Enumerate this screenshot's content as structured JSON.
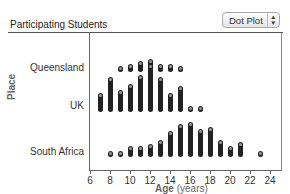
{
  "header": {
    "title": "Participating Students",
    "plot_type_select": {
      "selected": "Dot Plot"
    }
  },
  "chart_data": {
    "type": "dot",
    "title": "Participating Students",
    "xlabel": "Age",
    "xlabel_unit": "(years)",
    "ylabel": "Place",
    "xlim": [
      6,
      24
    ],
    "xticks": [
      6,
      8,
      10,
      12,
      14,
      16,
      18,
      20,
      22,
      24
    ],
    "categories": [
      "Queensland",
      "UK",
      "South Africa"
    ],
    "series": [
      {
        "name": "Queensland",
        "ages": [
          9,
          10,
          11,
          12,
          13,
          14,
          15
        ],
        "counts": [
          1,
          2,
          3,
          4,
          2,
          2,
          1
        ]
      },
      {
        "name": "UK",
        "ages": [
          7,
          8,
          9,
          10,
          11,
          12,
          13,
          14,
          15,
          16,
          17
        ],
        "counts": [
          7,
          14,
          8,
          11,
          15,
          20,
          14,
          7,
          10,
          1,
          1
        ]
      },
      {
        "name": "South Africa",
        "ages": [
          8,
          9,
          10,
          11,
          12,
          13,
          14,
          15,
          16,
          17,
          18,
          19,
          20,
          21,
          23
        ],
        "counts": [
          1,
          1,
          3,
          3,
          4,
          6,
          10,
          13,
          14,
          11,
          12,
          6,
          3,
          5,
          1
        ]
      }
    ]
  },
  "labels": {
    "place_axis": "Place",
    "age_axis": "Age",
    "age_unit": "(years)",
    "rows": [
      "Queensland",
      "UK",
      "South Africa"
    ],
    "xticks": [
      "6",
      "8",
      "10",
      "12",
      "14",
      "16",
      "18",
      "20",
      "22",
      "24"
    ]
  }
}
